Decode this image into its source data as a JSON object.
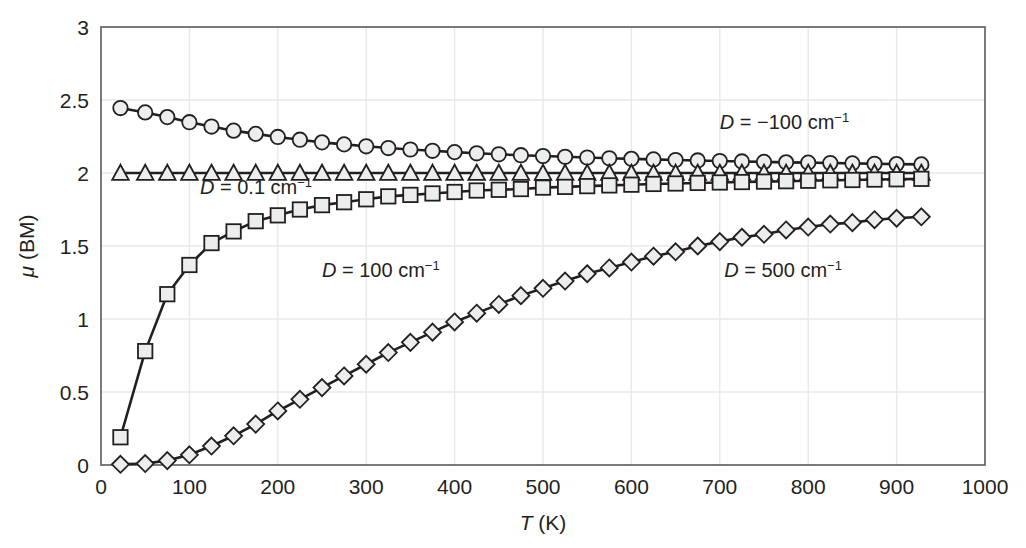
{
  "chart_data": {
    "type": "line",
    "title": "",
    "xlabel": "T (K)",
    "ylabel": "μ (BM)",
    "xlabel_parts": {
      "symbol": "T",
      "unit": " (K)"
    },
    "ylabel_parts": {
      "symbol": "μ",
      "unit": " (BM)"
    },
    "xlim": [
      0,
      1000
    ],
    "ylim": [
      0,
      3
    ],
    "xticks": [
      0,
      100,
      200,
      300,
      400,
      500,
      600,
      700,
      800,
      900,
      1000
    ],
    "xticklabels": [
      "0",
      "100",
      "200",
      "300",
      "400",
      "500",
      "600",
      "700",
      "800",
      "900",
      "1000"
    ],
    "yticks": [
      0,
      0.5,
      1,
      1.5,
      2,
      2.5,
      3
    ],
    "yticklabels": [
      "0",
      "0.5",
      "1",
      "1.5",
      "2",
      "2.5",
      "3"
    ],
    "grid": true,
    "grid_color": "#e8e8e8",
    "frame_color": "#5a5a5a",
    "legend": "inline-annotations",
    "series": [
      {
        "name": "D = -100 cm^-1",
        "marker": "circle",
        "marker_fill": "#eceded",
        "marker_edge": "#231f20",
        "line_color": "#231f20",
        "x": [
          22,
          50,
          75,
          100,
          125,
          150,
          175,
          200,
          225,
          250,
          275,
          300,
          325,
          350,
          375,
          400,
          425,
          450,
          475,
          500,
          525,
          550,
          575,
          600,
          625,
          650,
          675,
          700,
          725,
          750,
          775,
          800,
          825,
          850,
          875,
          900,
          928
        ],
        "y": [
          2.445,
          2.415,
          2.383,
          2.348,
          2.318,
          2.29,
          2.268,
          2.247,
          2.228,
          2.21,
          2.196,
          2.183,
          2.171,
          2.161,
          2.152,
          2.143,
          2.135,
          2.128,
          2.122,
          2.116,
          2.111,
          2.106,
          2.101,
          2.097,
          2.093,
          2.089,
          2.086,
          2.082,
          2.079,
          2.076,
          2.073,
          2.071,
          2.068,
          2.066,
          2.063,
          2.061,
          2.059
        ]
      },
      {
        "name": "D = 0.1 cm^-1",
        "marker": "triangle",
        "marker_fill": "#eceded",
        "marker_edge": "#231f20",
        "line_color": "#231f20",
        "x": [
          22,
          50,
          75,
          100,
          125,
          150,
          175,
          200,
          225,
          250,
          275,
          300,
          325,
          350,
          375,
          400,
          425,
          450,
          475,
          500,
          525,
          550,
          575,
          600,
          625,
          650,
          675,
          700,
          725,
          750,
          775,
          800,
          825,
          850,
          875,
          900,
          928
        ],
        "y": [
          2.0,
          2.0,
          2.0,
          2.0,
          2.0,
          2.0,
          2.0,
          2.0,
          2.0,
          2.0,
          2.0,
          2.0,
          2.0,
          2.0,
          2.0,
          2.0,
          2.0,
          2.0,
          2.0,
          2.0,
          2.0,
          2.0,
          2.0,
          2.0,
          2.0,
          2.0,
          2.0,
          2.0,
          2.0,
          2.0,
          2.0,
          2.0,
          2.0,
          2.0,
          2.0,
          2.0,
          2.0
        ]
      },
      {
        "name": "D = 100 cm^-1",
        "marker": "square",
        "marker_fill": "#eceded",
        "marker_edge": "#231f20",
        "line_color": "#231f20",
        "x": [
          22,
          50,
          75,
          100,
          125,
          150,
          175,
          200,
          225,
          250,
          275,
          300,
          325,
          350,
          375,
          400,
          425,
          450,
          475,
          500,
          525,
          550,
          575,
          600,
          625,
          650,
          675,
          700,
          725,
          750,
          775,
          800,
          825,
          850,
          875,
          900,
          928
        ],
        "y": [
          0.19,
          0.78,
          1.17,
          1.37,
          1.52,
          1.6,
          1.67,
          1.71,
          1.75,
          1.78,
          1.8,
          1.82,
          1.84,
          1.85,
          1.86,
          1.87,
          1.88,
          1.885,
          1.89,
          1.9,
          1.905,
          1.91,
          1.915,
          1.92,
          1.925,
          1.928,
          1.932,
          1.935,
          1.938,
          1.941,
          1.944,
          1.947,
          1.95,
          1.952,
          1.955,
          1.957,
          1.96
        ]
      },
      {
        "name": "D = 500 cm^-1",
        "marker": "diamond",
        "marker_fill": "#eceded",
        "marker_edge": "#231f20",
        "line_color": "#231f20",
        "x": [
          22,
          50,
          75,
          100,
          125,
          150,
          175,
          200,
          225,
          250,
          275,
          300,
          325,
          350,
          375,
          400,
          425,
          450,
          475,
          500,
          525,
          550,
          575,
          600,
          625,
          650,
          675,
          700,
          725,
          750,
          775,
          800,
          825,
          850,
          875,
          900,
          928
        ],
        "y": [
          0.005,
          0.01,
          0.03,
          0.07,
          0.13,
          0.2,
          0.28,
          0.37,
          0.45,
          0.53,
          0.61,
          0.69,
          0.77,
          0.84,
          0.91,
          0.98,
          1.04,
          1.1,
          1.16,
          1.21,
          1.26,
          1.31,
          1.35,
          1.39,
          1.43,
          1.46,
          1.5,
          1.53,
          1.56,
          1.58,
          1.61,
          1.63,
          1.65,
          1.66,
          1.68,
          1.69,
          1.7
        ]
      }
    ],
    "annotations": [
      {
        "id": "ann-dneg100",
        "prefix": "D",
        "eq": " = −100 cm",
        "sup": "−1",
        "x": 700,
        "y": 2.3
      },
      {
        "id": "ann-d01",
        "prefix": "D",
        "eq": " = 0.1 cm",
        "sup": "−1",
        "x": 112,
        "y": 1.855
      },
      {
        "id": "ann-d100",
        "prefix": "D",
        "eq": " = 100 cm",
        "sup": "−1",
        "x": 250,
        "y": 1.29
      },
      {
        "id": "ann-d500",
        "prefix": "D",
        "eq": " = 500 cm",
        "sup": "−1",
        "x": 705,
        "y": 1.29
      }
    ]
  }
}
